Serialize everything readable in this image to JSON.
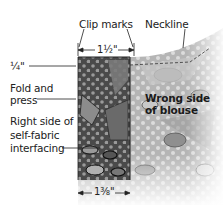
{
  "labels": {
    "clip_marks": "Clip marks",
    "neckline": "Neckline",
    "quarter_inch": "¼\"",
    "fold_line1": "Fold and",
    "fold_line2": "press",
    "right_side_line1": "Right side of",
    "right_side_line2": "self-fabric",
    "right_side_line3": "interfacing",
    "wrong_side_line1": "Wrong side",
    "wrong_side_line2": "of blouse"
  },
  "dimensions": {
    "top_width": "1½\"",
    "bottom_width": "1⅜\""
  },
  "colors": {
    "blouse_fabric": "#b8b8b8",
    "interfacing_fabric": "#6e6e6e",
    "dots": "#d8d8d8",
    "outline": "#222222"
  }
}
